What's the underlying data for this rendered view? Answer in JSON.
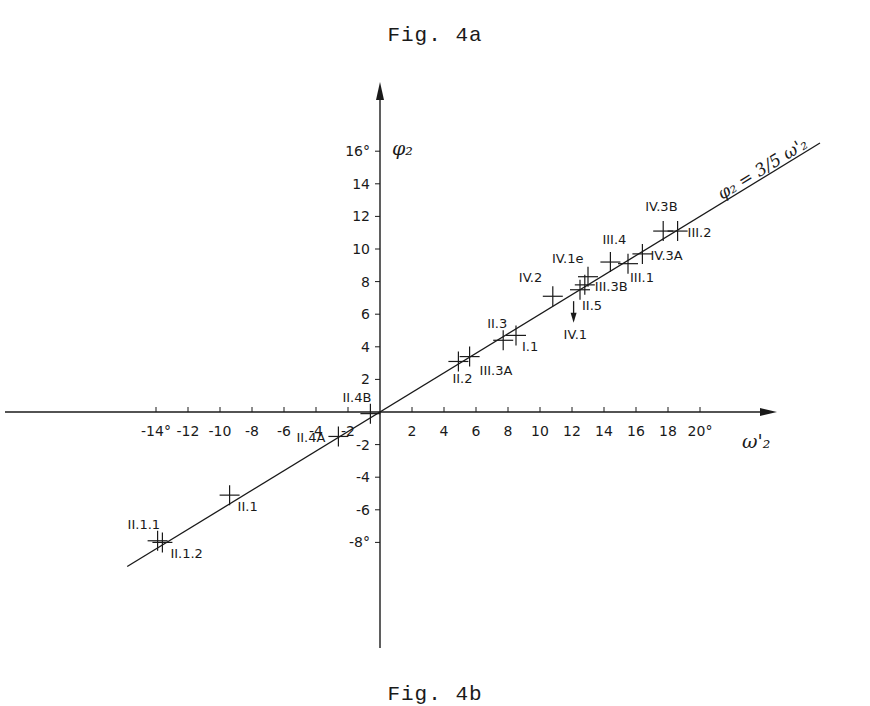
{
  "figure": {
    "title": "Fig. 4a",
    "footer": "Fig. 4b"
  },
  "chart_data": {
    "type": "scatter",
    "title": "Fig. 4a",
    "xlabel": "ω'₂",
    "ylabel": "φ₂",
    "xlim": [
      -16,
      24
    ],
    "ylim": [
      -14,
      18
    ],
    "grid": false,
    "legend": null,
    "x_ticks": [
      -14,
      -12,
      -10,
      -8,
      -6,
      -4,
      -2,
      2,
      4,
      6,
      8,
      10,
      12,
      14,
      16,
      18,
      20
    ],
    "x_tick_labels": [
      "-14°",
      "-12",
      "-10",
      "-8",
      "-6",
      "-4",
      "-2",
      "2",
      "4",
      "6",
      "8",
      "10",
      "12",
      "14",
      "16",
      "18",
      "20°"
    ],
    "y_ticks": [
      16,
      14,
      12,
      10,
      8,
      6,
      4,
      2,
      -2,
      -4,
      -6,
      -8
    ],
    "y_tick_labels": [
      "16°",
      "14",
      "12",
      "10",
      "8",
      "6",
      "4",
      "2",
      "-2",
      "-4",
      "-6",
      "-8°"
    ],
    "fit_line": {
      "label": "φ₂ = 3/5 ω'₂",
      "slope": 0.6,
      "intercept": 0,
      "x_range": [
        -15.8,
        27.5
      ]
    },
    "points": [
      {
        "label": "II.1.1",
        "x": -13.9,
        "y": -7.9
      },
      {
        "label": "II.1.2",
        "x": -13.6,
        "y": -8.0
      },
      {
        "label": "II.1",
        "x": -9.4,
        "y": -5.1
      },
      {
        "label": "II.4A",
        "x": -2.6,
        "y": -1.5
      },
      {
        "label": "II.4B",
        "x": -0.6,
        "y": -0.1
      },
      {
        "label": "II.2",
        "x": 4.9,
        "y": 3.1
      },
      {
        "label": "III.3A",
        "x": 5.6,
        "y": 3.4
      },
      {
        "label": "II.3",
        "x": 7.7,
        "y": 4.4
      },
      {
        "label": "I.1",
        "x": 8.5,
        "y": 4.7
      },
      {
        "label": "IV.2",
        "x": 10.8,
        "y": 7.1
      },
      {
        "label": "II.5",
        "x": 12.5,
        "y": 7.5
      },
      {
        "label": "III.3B",
        "x": 12.8,
        "y": 7.8
      },
      {
        "label": "IV.1e",
        "x": 13.0,
        "y": 8.3
      },
      {
        "label": "III.4",
        "x": 14.4,
        "y": 9.2
      },
      {
        "label": "III.1",
        "x": 15.5,
        "y": 9.1
      },
      {
        "label": "IV.3A",
        "x": 16.4,
        "y": 9.7
      },
      {
        "label": "IV.3B",
        "x": 17.7,
        "y": 11.1
      },
      {
        "label": "III.2",
        "x": 18.6,
        "y": 11.1
      }
    ],
    "annotations": [
      {
        "label": "IV.1",
        "type": "arrow-down",
        "x": 12.1,
        "y_from": 6.8,
        "y_to": 5.6
      }
    ]
  }
}
